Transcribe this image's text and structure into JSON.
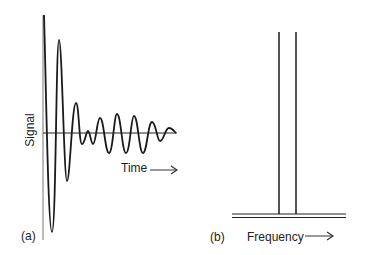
{
  "panel_a": {
    "label": "(a)",
    "y_axis_label": "Signal",
    "x_axis_label": "Time",
    "description": "Damped oscillating time-domain signal (beat pattern)"
  },
  "panel_b": {
    "label": "(b)",
    "x_axis_label": "Frequency",
    "description": "Frequency-domain spectrum with two sharp peaks"
  },
  "colors": {
    "line": "#1a1a1a",
    "axis": "#555555",
    "background": "#ffffff"
  }
}
